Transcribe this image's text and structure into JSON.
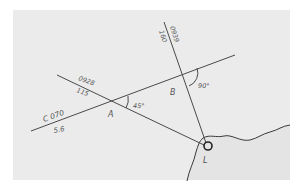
{
  "diagram": {
    "type": "navigation-running-fix",
    "colors": {
      "page_background": "#ffffff",
      "panel_background": "#ebebeb",
      "line": "#4a4a4a",
      "text": "#555555",
      "lighthouse": "#222222"
    },
    "course_line": {
      "course_label": "C 070",
      "speed_label": "5.6"
    },
    "bearing_a": {
      "time_label": "0928",
      "bearing_label": "115",
      "point_label": "A",
      "angle_label": "45°"
    },
    "bearing_b": {
      "time_label": "0939",
      "bearing_label": "160",
      "point_label": "B",
      "angle_label": "90°"
    },
    "lighthouse": {
      "label": "L"
    }
  }
}
